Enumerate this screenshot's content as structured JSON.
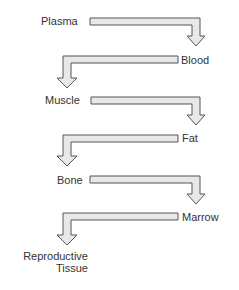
{
  "diagram": {
    "type": "flow",
    "colors": {
      "arrow_fill": "#e8e8e8",
      "arrow_stroke": "#555555",
      "text": "#333333"
    },
    "nodes": [
      {
        "id": "plasma",
        "label": "Plasma"
      },
      {
        "id": "blood",
        "label": "Blood"
      },
      {
        "id": "muscle",
        "label": "Muscle"
      },
      {
        "id": "fat",
        "label": "Fat"
      },
      {
        "id": "bone",
        "label": "Bone"
      },
      {
        "id": "marrow",
        "label": "Marrow"
      },
      {
        "id": "reproductive",
        "label_line1": "Reproductive",
        "label_line2": "Tissue"
      }
    ],
    "edges": [
      {
        "from": "Plasma",
        "to": "Blood"
      },
      {
        "from": "Blood",
        "to": "Muscle"
      },
      {
        "from": "Muscle",
        "to": "Fat"
      },
      {
        "from": "Fat",
        "to": "Bone"
      },
      {
        "from": "Bone",
        "to": "Marrow"
      },
      {
        "from": "Marrow",
        "to": "Reproductive Tissue"
      }
    ]
  }
}
